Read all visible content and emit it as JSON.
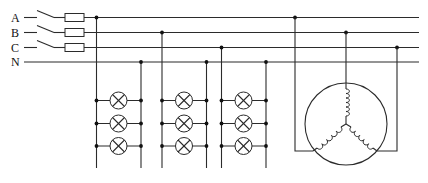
{
  "diagram": {
    "colors": {
      "wire": "#2b2b2b",
      "node": "#111111",
      "background": "#ffffff"
    },
    "phases": [
      {
        "label": "A",
        "y": 17.5,
        "switch": true,
        "fuse": true
      },
      {
        "label": "B",
        "y": 32.5,
        "switch": true,
        "fuse": true
      },
      {
        "label": "C",
        "y": 47.5,
        "switch": true,
        "fuse": true
      },
      {
        "label": "N",
        "y": 62.0,
        "switch": false,
        "fuse": false
      }
    ],
    "bus_end_x": 419,
    "lamp_groups": [
      {
        "phase": "A",
        "left_x": 96.5,
        "right_x": 141,
        "lamp_x": 118.5,
        "top_y": 17.5,
        "neutral_y": 62
      },
      {
        "phase": "B",
        "left_x": 162,
        "right_x": 206.5,
        "lamp_x": 184,
        "top_y": 32.5,
        "neutral_y": 62
      },
      {
        "phase": "C",
        "left_x": 221.5,
        "right_x": 266,
        "lamp_x": 243.5,
        "top_y": 47.5,
        "neutral_y": 62
      }
    ],
    "lamp_rows_y": [
      100.5,
      123.5,
      146
    ],
    "lamp_radius": 8.5,
    "vertical_bottom_y": 168,
    "motor": {
      "label": "3-phase motor (star connection)",
      "center_x": 346,
      "center_y": 124,
      "radius": 41,
      "star_x": 346,
      "star_y": 124,
      "phase_A_x": 295,
      "phase_B_x": 346,
      "phase_C_x": 397,
      "terminal_y": 151
    }
  }
}
